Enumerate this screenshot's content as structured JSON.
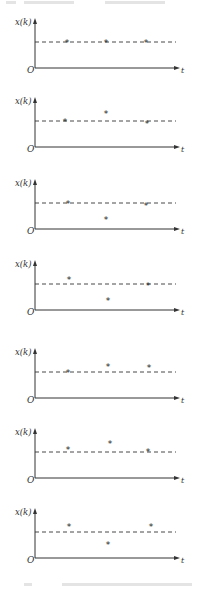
{
  "figure": {
    "panels": [
      {
        "id": 1,
        "top": 14,
        "y_label": "x(k)",
        "origin_label": "O",
        "x_label": "t",
        "points": [
          {
            "x": 67,
            "dy": 0
          },
          {
            "x": 106,
            "dy": 0
          },
          {
            "x": 146,
            "dy": 0
          }
        ]
      },
      {
        "id": 2,
        "top": 93,
        "y_label": "x(k)",
        "origin_label": "O",
        "x_label": "t",
        "points": [
          {
            "x": 65,
            "dy": 0
          },
          {
            "x": 106,
            "dy": -8
          },
          {
            "x": 147,
            "dy": 2
          }
        ]
      },
      {
        "id": 3,
        "top": 175,
        "y_label": "x(k)",
        "origin_label": "O",
        "x_label": "t",
        "points": [
          {
            "x": 68,
            "dy": 0
          },
          {
            "x": 106,
            "dy": 16
          },
          {
            "x": 146,
            "dy": 2
          }
        ]
      },
      {
        "id": 4,
        "top": 256,
        "y_label": "x(k)",
        "origin_label": "O",
        "x_label": "t",
        "points": [
          {
            "x": 69,
            "dy": -5
          },
          {
            "x": 108,
            "dy": 16
          },
          {
            "x": 148,
            "dy": 1
          }
        ]
      },
      {
        "id": 5,
        "top": 344,
        "y_label": "x(k)",
        "origin_label": "O",
        "x_label": "t",
        "points": [
          {
            "x": 68,
            "dy": 0
          },
          {
            "x": 108,
            "dy": -6
          },
          {
            "x": 149,
            "dy": -5
          }
        ]
      },
      {
        "id": 6,
        "top": 424,
        "y_label": "x(k)",
        "origin_label": "O",
        "x_label": "t",
        "points": [
          {
            "x": 68,
            "dy": -3
          },
          {
            "x": 110,
            "dy": -9
          },
          {
            "x": 148,
            "dy": -1
          }
        ]
      },
      {
        "id": 7,
        "top": 504,
        "y_label": "x(k)",
        "origin_label": "O",
        "x_label": "t",
        "points": [
          {
            "x": 69,
            "dy": -6
          },
          {
            "x": 108,
            "dy": 12
          },
          {
            "x": 151,
            "dy": -6
          }
        ]
      }
    ],
    "marker": "*",
    "line_color": "#333333"
  }
}
